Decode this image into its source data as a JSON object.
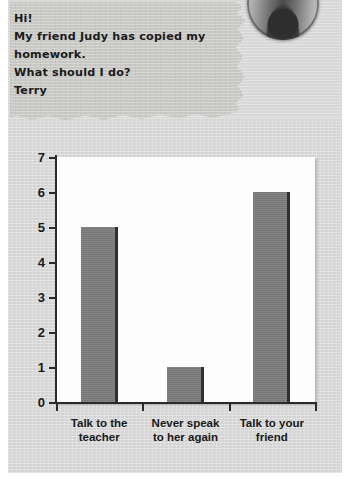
{
  "note": {
    "name": "handwritten-note",
    "lines": [
      "Hi!",
      "My friend Judy has copied my",
      "homework.",
      "What should I do?",
      "Terry"
    ]
  },
  "photo": {
    "alt": "portrait-photo"
  },
  "chart_data": {
    "type": "bar",
    "title": "",
    "xlabel": "",
    "ylabel": "",
    "categories": [
      "Talk to the teacher",
      "Never speak to her again",
      "Talk to your friend"
    ],
    "category_lines": [
      [
        "Talk to the",
        "teacher"
      ],
      [
        "Never speak",
        "to her again"
      ],
      [
        "Talk to your",
        "friend"
      ]
    ],
    "values": [
      5,
      1,
      6
    ],
    "ylim": [
      0,
      7
    ],
    "ytick_labels": [
      "0",
      "1",
      "2",
      "3",
      "4",
      "5",
      "6",
      "7"
    ],
    "ytick_values": [
      0,
      1,
      2,
      3,
      4,
      5,
      6,
      7
    ],
    "grid": false,
    "legend": false,
    "bar_color": "#7c7c7c",
    "bar_edge_color": "#303030",
    "axis_color": "#2a2a2a",
    "plot_background": "#fdfdfd",
    "page_background": "#d4d4d4"
  }
}
